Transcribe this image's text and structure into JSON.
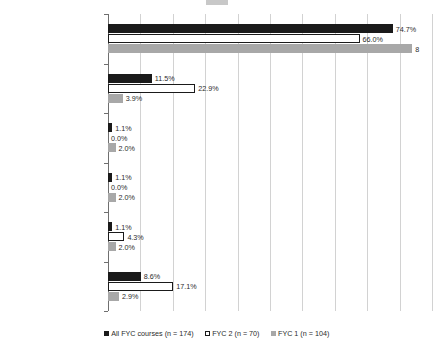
{
  "chart_data": {
    "type": "bar",
    "orientation": "horizontal",
    "title": "",
    "xlabel": "",
    "ylabel": "",
    "xlim": [
      0,
      85
    ],
    "grid": true,
    "gridline_step": 8.5,
    "legend_position": "bottom",
    "categories": [
      "Topic not specified",
      "Research",
      "Topic defined by students",
      "Specific announced topic",
      "Discipline-based",
      "Literature"
    ],
    "series": [
      {
        "name": "All FYC courses  (n = 174)",
        "key": "all",
        "color": "#1a1a1a",
        "values": [
          74.7,
          11.5,
          1.1,
          1.1,
          1.1,
          8.6
        ],
        "labels": [
          "74.7%",
          "11.5%",
          "1.1%",
          "1.1%",
          "1.1%",
          "8.6%"
        ]
      },
      {
        "name": "FYC 2 (n = 70)",
        "key": "fyc2",
        "color": "#ffffff",
        "values": [
          66.0,
          22.9,
          0.0,
          0.0,
          4.3,
          17.1
        ],
        "labels": [
          "66.0%",
          "22.9%",
          "0.0%",
          "0.0%",
          "4.3%",
          "17.1%"
        ]
      },
      {
        "name": "FYC 1 (n = 104)",
        "key": "fyc1",
        "color": "#a8a8a8",
        "values": [
          79.8,
          3.9,
          2.0,
          2.0,
          2.0,
          2.9
        ],
        "labels": [
          "8",
          "3.9%",
          "2.0%",
          "2.0%",
          "2.0%",
          "2.9%"
        ]
      }
    ]
  },
  "legend": {
    "items": [
      {
        "label": "All FYC courses  (n = 174)",
        "swatch": "s-all"
      },
      {
        "label": "FYC 2 (n = 70)",
        "swatch": "s-fyc2"
      },
      {
        "label": "FYC 1 (n = 104)",
        "swatch": "s-fyc1"
      }
    ]
  }
}
